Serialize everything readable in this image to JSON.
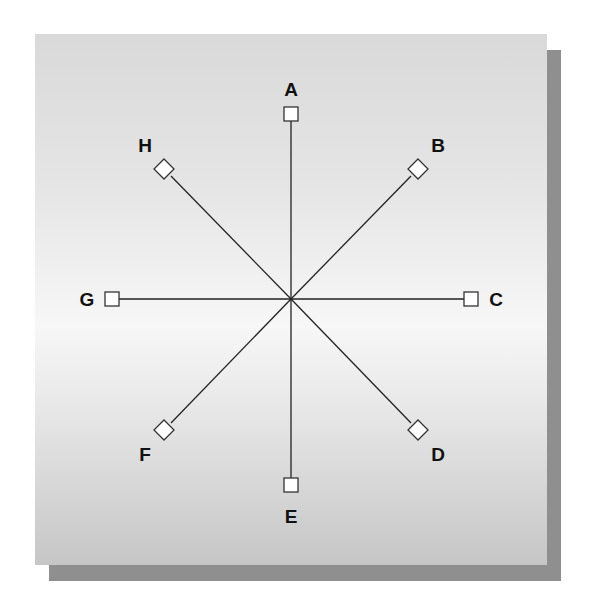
{
  "diagram": {
    "type": "radial-star",
    "center": {
      "x": 291,
      "y": 299
    },
    "nodes": [
      {
        "id": "A",
        "label": "A",
        "shape": "square",
        "x": 291,
        "y": 114,
        "lx": 291,
        "ly": 96
      },
      {
        "id": "B",
        "label": "B",
        "shape": "diamond",
        "x": 418,
        "y": 169,
        "lx": 438,
        "ly": 152
      },
      {
        "id": "C",
        "label": "C",
        "shape": "square",
        "x": 471,
        "y": 299,
        "lx": 496,
        "ly": 306
      },
      {
        "id": "D",
        "label": "D",
        "shape": "diamond",
        "x": 418,
        "y": 430,
        "lx": 438,
        "ly": 461
      },
      {
        "id": "E",
        "label": "E",
        "shape": "square",
        "x": 291,
        "y": 485,
        "lx": 291,
        "ly": 523
      },
      {
        "id": "F",
        "label": "F",
        "shape": "diamond",
        "x": 164,
        "y": 430,
        "lx": 145,
        "ly": 461
      },
      {
        "id": "G",
        "label": "G",
        "shape": "square",
        "x": 112,
        "y": 299,
        "lx": 87,
        "ly": 306
      },
      {
        "id": "H",
        "label": "H",
        "shape": "diamond",
        "x": 164,
        "y": 169,
        "lx": 145,
        "ly": 152
      }
    ]
  },
  "labels": {
    "A": "A",
    "B": "B",
    "C": "C",
    "D": "D",
    "E": "E",
    "F": "F",
    "G": "G",
    "H": "H"
  }
}
